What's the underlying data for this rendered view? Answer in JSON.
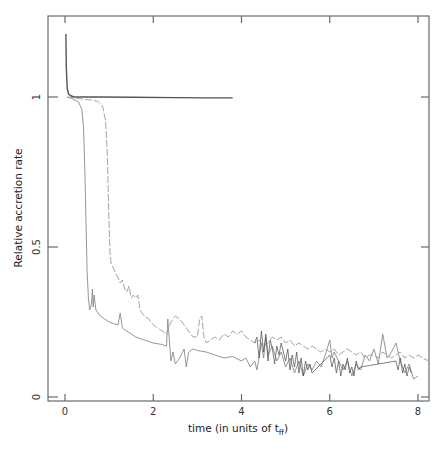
{
  "chart_data": {
    "type": "line",
    "title": "",
    "xlabel": "time (in units of t",
    "xlabel_sub": "ff",
    "xlabel_end": ")",
    "ylabel": "Relative accretion rate",
    "xlim": [
      -0.4,
      8.3
    ],
    "ylim": [
      -0.013,
      1.27
    ],
    "x_ticks": [
      0,
      2,
      4,
      6,
      8
    ],
    "x_tick_labels": [
      "0",
      "2",
      "4",
      "6",
      "8"
    ],
    "y_ticks": [
      0,
      0.5,
      1
    ],
    "y_tick_labels": [
      "0",
      "0.5",
      "1"
    ],
    "grid": false,
    "legend": null,
    "series": [
      {
        "name": "constant rate",
        "style": "solid",
        "color": "#555555",
        "width": 1.4,
        "x": [
          0.02,
          0.03,
          0.05,
          0.08,
          0.12,
          0.2,
          0.4,
          0.8,
          1.5,
          2.5,
          3.2,
          3.8
        ],
        "y": [
          1.21,
          1.1,
          1.03,
          1.01,
          1.005,
          1.0,
          1.0,
          1.0,
          0.999,
          0.998,
          0.997,
          0.997
        ]
      },
      {
        "name": "early decline",
        "style": "solid",
        "color": "#8a8a8a",
        "width": 0.9,
        "x": [
          0.05,
          0.15,
          0.3,
          0.38,
          0.42,
          0.45,
          0.48,
          0.5,
          0.53,
          0.56,
          0.6,
          0.62,
          0.64,
          0.66,
          0.7,
          0.75,
          0.8,
          0.9,
          1.0,
          1.1,
          1.2,
          1.25,
          1.3,
          1.4,
          1.5,
          1.6,
          1.8,
          2.0,
          2.2,
          2.3,
          2.33,
          2.36,
          2.4,
          2.45,
          2.5,
          2.6,
          2.7,
          2.75,
          2.8,
          2.9,
          3.0,
          3.2,
          3.4,
          3.6,
          3.8,
          4.0,
          4.1,
          4.2,
          4.3,
          4.35,
          4.45,
          4.5,
          4.55,
          4.6,
          4.7,
          4.8,
          4.9,
          5.0,
          5.1,
          5.2,
          5.3,
          5.4,
          5.5,
          5.6,
          5.7,
          5.8,
          5.9,
          6.0,
          6.05,
          6.1,
          6.2,
          6.3,
          6.4,
          6.5,
          6.6,
          6.7,
          6.8,
          6.9,
          7.0,
          7.1,
          7.2,
          7.3,
          7.4,
          7.5,
          7.6,
          7.7,
          7.8,
          7.9,
          8.0
        ],
        "y": [
          1.0,
          0.995,
          0.985,
          0.96,
          0.9,
          0.75,
          0.55,
          0.42,
          0.33,
          0.29,
          0.31,
          0.36,
          0.3,
          0.34,
          0.29,
          0.28,
          0.27,
          0.26,
          0.25,
          0.245,
          0.24,
          0.28,
          0.23,
          0.22,
          0.21,
          0.2,
          0.19,
          0.18,
          0.175,
          0.17,
          0.26,
          0.2,
          0.12,
          0.15,
          0.11,
          0.13,
          0.16,
          0.1,
          0.15,
          0.16,
          0.155,
          0.15,
          0.14,
          0.13,
          0.135,
          0.12,
          0.13,
          0.1,
          0.12,
          0.09,
          0.18,
          0.13,
          0.2,
          0.14,
          0.17,
          0.12,
          0.15,
          0.1,
          0.13,
          0.08,
          0.12,
          0.07,
          0.11,
          0.09,
          0.12,
          0.1,
          0.14,
          0.19,
          0.13,
          0.15,
          0.12,
          0.09,
          0.12,
          0.07,
          0.11,
          0.09,
          0.14,
          0.12,
          0.16,
          0.11,
          0.21,
          0.13,
          0.15,
          0.18,
          0.12,
          0.08,
          0.11,
          0.06,
          0.07
        ]
      },
      {
        "name": "delayed decline",
        "style": "dashed",
        "color": "#9a9a9a",
        "width": 0.9,
        "x": [
          0.05,
          0.2,
          0.4,
          0.6,
          0.75,
          0.85,
          0.92,
          0.96,
          0.99,
          1.02,
          1.05,
          1.1,
          1.15,
          1.2,
          1.25,
          1.3,
          1.35,
          1.4,
          1.45,
          1.5,
          1.55,
          1.6,
          1.65,
          1.7,
          1.75,
          1.8,
          1.9,
          2.0,
          2.1,
          2.2,
          2.3,
          2.4,
          2.5,
          2.6,
          2.7,
          2.8,
          2.9,
          3.0,
          3.05,
          3.1,
          3.15,
          3.2,
          3.3,
          3.4,
          3.5,
          3.6,
          3.7,
          3.8,
          3.9,
          4.0,
          4.1,
          4.2,
          4.3,
          4.4,
          4.5,
          4.6,
          4.7,
          4.8,
          4.9,
          5.0,
          5.1,
          5.2,
          5.3,
          5.4,
          5.5,
          5.6,
          5.7,
          5.8,
          5.9,
          6.0,
          6.1,
          6.2,
          6.3,
          6.4,
          6.5,
          6.6,
          6.7,
          6.8,
          6.9,
          7.0,
          7.1,
          7.2,
          7.3,
          7.4,
          7.5,
          7.6,
          7.7,
          7.8,
          7.9,
          8.0,
          8.1,
          8.25
        ],
        "y": [
          1.0,
          0.997,
          0.993,
          0.99,
          0.985,
          0.97,
          0.92,
          0.8,
          0.62,
          0.48,
          0.44,
          0.43,
          0.41,
          0.4,
          0.38,
          0.39,
          0.36,
          0.35,
          0.37,
          0.33,
          0.34,
          0.33,
          0.34,
          0.29,
          0.28,
          0.27,
          0.26,
          0.24,
          0.23,
          0.22,
          0.21,
          0.25,
          0.27,
          0.26,
          0.24,
          0.22,
          0.2,
          0.2,
          0.26,
          0.27,
          0.2,
          0.18,
          0.19,
          0.2,
          0.19,
          0.21,
          0.2,
          0.22,
          0.21,
          0.22,
          0.2,
          0.19,
          0.18,
          0.19,
          0.17,
          0.18,
          0.2,
          0.19,
          0.2,
          0.18,
          0.19,
          0.17,
          0.18,
          0.17,
          0.16,
          0.17,
          0.16,
          0.15,
          0.16,
          0.15,
          0.16,
          0.14,
          0.15,
          0.16,
          0.15,
          0.14,
          0.15,
          0.13,
          0.14,
          0.14,
          0.13,
          0.15,
          0.14,
          0.13,
          0.14,
          0.15,
          0.13,
          0.14,
          0.13,
          0.14,
          0.13,
          0.12
        ]
      },
      {
        "name": "noisy overlay",
        "style": "solid",
        "color": "#4a4a4a",
        "width": 0.7,
        "x": [
          4.3,
          4.35,
          4.4,
          4.45,
          4.5,
          4.55,
          4.6,
          4.65,
          4.7,
          4.75,
          4.8,
          4.85,
          4.9,
          5.0,
          5.05,
          5.1,
          5.15,
          5.2,
          5.25,
          5.3,
          5.35,
          5.4,
          5.45,
          5.5,
          5.55,
          5.6,
          6.0,
          6.05,
          6.1,
          6.15,
          6.2,
          6.25,
          6.3,
          6.35,
          6.4,
          6.45,
          6.5,
          6.55,
          6.6,
          6.65,
          6.7,
          7.5,
          7.55,
          7.6,
          7.65,
          7.7,
          7.75,
          7.8,
          7.85
        ],
        "y": [
          0.18,
          0.2,
          0.13,
          0.22,
          0.15,
          0.21,
          0.12,
          0.19,
          0.16,
          0.11,
          0.17,
          0.14,
          0.18,
          0.12,
          0.16,
          0.09,
          0.14,
          0.1,
          0.15,
          0.08,
          0.13,
          0.07,
          0.12,
          0.09,
          0.11,
          0.08,
          0.14,
          0.1,
          0.13,
          0.08,
          0.12,
          0.07,
          0.11,
          0.09,
          0.13,
          0.08,
          0.1,
          0.07,
          0.12,
          0.09,
          0.1,
          0.12,
          0.09,
          0.13,
          0.08,
          0.11,
          0.07,
          0.1,
          0.08
        ]
      }
    ]
  }
}
